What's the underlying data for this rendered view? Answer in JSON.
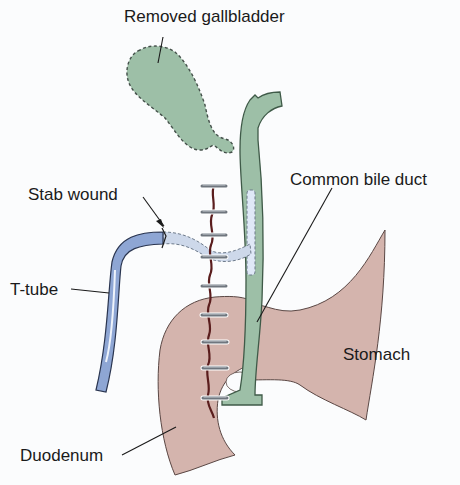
{
  "diagram": {
    "type": "medical-illustration",
    "colors": {
      "background": "#fbfcfd",
      "gallbladder_fill": "#9dbfa7",
      "bile_duct_fill": "#9dbfa7",
      "bile_duct_stroke": "#3f5a48",
      "stomach_fill": "#d4b4ad",
      "duodenum_fill": "#d4b4ad",
      "organ_stroke": "#5a4744",
      "t_tube_fill": "#8ea6d4",
      "t_tube_highlight": "#dfe8f7",
      "t_tube_inner": "#cdd8ea",
      "incision": "#5a1d1d",
      "sutures": "#8a8f95",
      "leader_lines": "#1a1a1a"
    },
    "labels": {
      "gallbladder": "Removed gallbladder",
      "bile_duct": "Common bile duct",
      "stab_wound": "Stab wound",
      "t_tube": "T-tube",
      "stomach": "Stomach",
      "duodenum": "Duodenum"
    },
    "suture_count": 9
  }
}
